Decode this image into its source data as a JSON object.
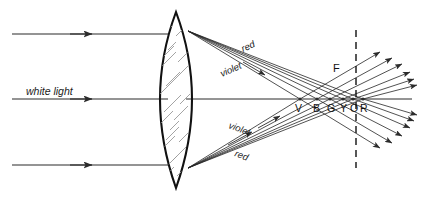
{
  "figure": {
    "background_color": "#ffffff",
    "line_color": "#2b2b2b",
    "hatch_color": "#9a9a9a",
    "width": 430,
    "height": 197
  },
  "labels": {
    "white_light": "white light",
    "red_upper": "red",
    "violet_upper": "violet",
    "violet_lower": "violet",
    "red_lower": "red",
    "focal_point": "F"
  },
  "spectrum": {
    "letters": [
      "V",
      "B",
      "G",
      "Y",
      "O",
      "R"
    ],
    "names": [
      "violet",
      "blue",
      "green",
      "yellow",
      "orange",
      "red"
    ],
    "focus_x": [
      300,
      317,
      330,
      343,
      353,
      363
    ],
    "axis_y": 99
  },
  "optics": {
    "lens": {
      "type": "biconvex",
      "center_x": 176,
      "top_y": 12,
      "bottom_y": 188,
      "half_thickness": 16
    },
    "optical_axis_y": 99,
    "focal_line_x": 356,
    "incoming_rays_y": [
      34,
      99,
      165
    ],
    "incoming_ray_count": 3
  },
  "icons": {
    "arrowhead": "arrowhead-icon",
    "dashed_line": "dashed-focal-line-icon"
  }
}
